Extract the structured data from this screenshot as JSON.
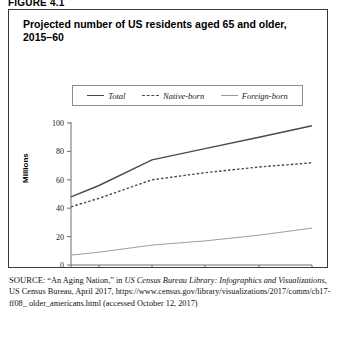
{
  "figure": {
    "label": "FIGURE 4.1"
  },
  "chart_title": "Projected number of US residents aged 65 and older, 2015–60",
  "legend": {
    "items": [
      {
        "label": "Total",
        "style": "solid",
        "color": "#4a4a4a"
      },
      {
        "label": "Native-born",
        "style": "dashed",
        "color": "#4a4a4a"
      },
      {
        "label": "Foreign-born",
        "style": "solid-light",
        "color": "#9e9e9e"
      }
    ]
  },
  "axes": {
    "y_title": "Millions",
    "y_ticks": [
      "0",
      "20",
      "40",
      "60",
      "80",
      "100"
    ],
    "x_ticks": [
      "2015",
      "2020",
      "2030",
      "2040",
      "2050",
      "2060"
    ]
  },
  "source": {
    "label": "SOURCE:",
    "line1_a": " “An Aging Nation,” in ",
    "line1_italic": "US Census Bureau Library:",
    "line2_italic": "Infographics and Visualizations",
    "line2_b": ", US Census Bureau, April 2017,",
    "line3": "https://www.census.gov/library/visualizations/2017/comm/cb17-ff08_",
    "line4": "older_americans.html (accessed October 12, 2017)"
  },
  "chart_data": {
    "type": "line",
    "title": "Projected number of US residents aged 65 and older, 2015–60",
    "xlabel": "",
    "ylabel": "Millions",
    "ylim": [
      0,
      100
    ],
    "xlim": [
      2015,
      2060
    ],
    "grid": false,
    "legend_position": "top-center",
    "x": [
      2015,
      2020,
      2030,
      2040,
      2050,
      2060
    ],
    "series": [
      {
        "name": "Total",
        "values": [
          48,
          56,
          74,
          82,
          90,
          98
        ]
      },
      {
        "name": "Native-born",
        "values": [
          41,
          47,
          60,
          65,
          69,
          72
        ]
      },
      {
        "name": "Foreign-born",
        "values": [
          7,
          9,
          14,
          17,
          21,
          26
        ]
      }
    ]
  }
}
